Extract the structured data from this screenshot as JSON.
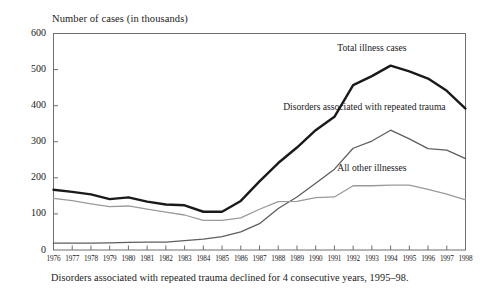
{
  "figure": {
    "y_axis_title": "Number of cases (in thousands)",
    "caption": "Disorders associated with repeated trauma declined for 4 consecutive years, 1995–98."
  },
  "chart_data": {
    "type": "line",
    "title": "",
    "subtitle": "",
    "xlabel": "",
    "ylabel": "Number of cases (in thousands)",
    "ylim": [
      0,
      600
    ],
    "yticks": [
      0,
      100,
      200,
      300,
      400,
      500,
      600
    ],
    "ytick_labels": [
      "0",
      "100",
      "200",
      "300",
      "400",
      "500",
      "600"
    ],
    "grid": false,
    "legend_position": "inline-annotations",
    "categories": [
      1976,
      1977,
      1978,
      1979,
      1980,
      1981,
      1982,
      1983,
      1984,
      1985,
      1986,
      1987,
      1988,
      1989,
      1990,
      1991,
      1992,
      1993,
      1994,
      1995,
      1996,
      1997,
      1998
    ],
    "xtick_labels": [
      "1976",
      "1977",
      "1978",
      "1979",
      "1980",
      "1981",
      "1982",
      "1983",
      "1984",
      "1985",
      "1986",
      "1987",
      "1988",
      "1989",
      "1990",
      "1991",
      "1992",
      "1993",
      "1994",
      "1995",
      "1996",
      "1997",
      "1998"
    ],
    "series": [
      {
        "name": "Total illness cases",
        "color": "#1a1a1a",
        "width": 2.4,
        "label_x": 1993,
        "label_y": 560,
        "values": [
          167,
          161,
          154,
          141,
          146,
          134,
          126,
          124,
          106,
          106,
          136,
          190,
          241,
          284,
          332,
          369,
          457,
          482,
          511,
          495,
          475,
          441,
          392
        ]
      },
      {
        "name": "Disorders associated with repeated trauma",
        "color": "#5e5e5e",
        "width": 1.3,
        "label_x": 1992,
        "label_y": 395,
        "values": [
          19,
          19,
          19,
          20,
          21,
          22,
          22,
          26,
          30,
          37,
          50,
          73,
          115,
          147,
          185,
          224,
          282,
          302,
          332,
          308,
          281,
          277,
          253
        ]
      },
      {
        "name": "All other illnesses",
        "color": "#9a9a9a",
        "width": 1.3,
        "label_x": 1993,
        "label_y": 228,
        "values": [
          143,
          137,
          128,
          120,
          122,
          113,
          105,
          97,
          82,
          82,
          89,
          113,
          134,
          135,
          145,
          147,
          178,
          178,
          180,
          180,
          168,
          155,
          139
        ]
      }
    ]
  }
}
